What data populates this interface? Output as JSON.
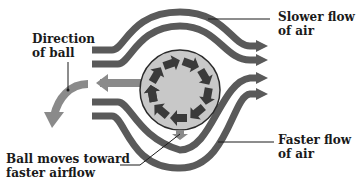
{
  "diagram": {
    "labels": {
      "direction_of_ball": [
        "Direction",
        "of ball"
      ],
      "slower_flow": [
        "Slower flow",
        "of air"
      ],
      "faster_flow": [
        "Faster flow",
        "of air"
      ],
      "ball_moves": [
        "Ball moves toward",
        "faster airflow"
      ]
    },
    "colors": {
      "flow_stream": "#5a5a5a",
      "ball_fill": "#c8c8c8",
      "ball_outline": "#2a2a2a",
      "spin_arrow": "#3a3a3a",
      "direction_arrow": "#8a8a8a",
      "text": "#1a1a1a"
    },
    "ball": {
      "cx": 180,
      "cy": 90,
      "r": 40,
      "spin": "counterclockwise"
    }
  }
}
